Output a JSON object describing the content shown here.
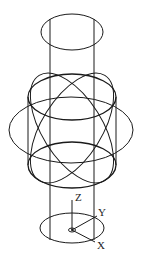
{
  "diagram": {
    "type": "3d-wireframe",
    "stroke_color": "#1a1a1a",
    "background": "#ffffff"
  },
  "axes": {
    "z_label": "Z",
    "y_label": "Y",
    "x_label": "X"
  }
}
